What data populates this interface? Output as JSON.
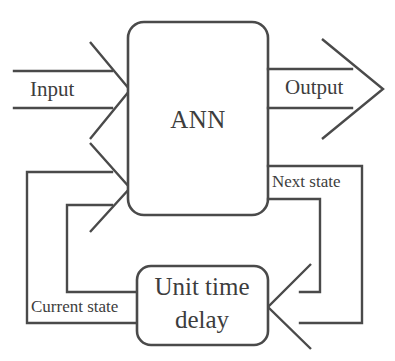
{
  "diagram": {
    "colors": {
      "stroke": "#4a4a4a",
      "text": "#3d3d3d",
      "background": "#ffffff"
    },
    "blocks": [
      {
        "id": "ann",
        "label": "ANN"
      },
      {
        "id": "delay",
        "label_line1": "Unit time",
        "label_line2": "delay"
      }
    ],
    "signals": [
      {
        "id": "input",
        "label": "Input"
      },
      {
        "id": "output",
        "label": "Output"
      },
      {
        "id": "next",
        "label": "Next state"
      },
      {
        "id": "current",
        "label": "Current state"
      }
    ]
  }
}
